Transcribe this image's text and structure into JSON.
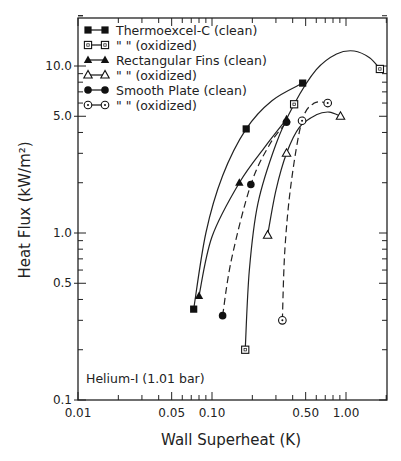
{
  "chart_data": {
    "type": "line",
    "title": "",
    "xlabel": "Wall Superheat (K)",
    "ylabel": "Heat Flux (kW/m²)",
    "xscale": "log",
    "yscale": "log",
    "xlim": [
      0.01,
      2.0
    ],
    "ylim": [
      0.1,
      31
    ],
    "x_ticks": [
      {
        "value": 0.01,
        "label": "0.01"
      },
      {
        "value": 0.05,
        "label": "0.05"
      },
      {
        "value": 0.1,
        "label": "0.10"
      },
      {
        "value": 0.5,
        "label": "0.50"
      },
      {
        "value": 1.0,
        "label": "1.00"
      }
    ],
    "y_ticks": [
      {
        "value": 0.1,
        "label": "0.1"
      },
      {
        "value": 0.5,
        "label": "0.5"
      },
      {
        "value": 1.0,
        "label": "1.0"
      },
      {
        "value": 5.0,
        "label": "5.0"
      },
      {
        "value": 10.0,
        "label": "10.0"
      }
    ],
    "grid": false,
    "legend_position": "upper-left",
    "annotation": "Helium-I (1.01 bar)",
    "series": [
      {
        "name": "Thermoexcel-C (clean)",
        "legend_label": "Thermoexcel-C (clean)",
        "marker": "square-filled",
        "line": "solid",
        "points": [
          [
            0.073,
            0.35
          ],
          [
            0.18,
            4.2
          ],
          [
            0.475,
            7.9
          ]
        ],
        "curve": [
          [
            0.073,
            0.35
          ],
          [
            0.09,
            1.0
          ],
          [
            0.12,
            2.2
          ],
          [
            0.18,
            4.2
          ],
          [
            0.28,
            6.2
          ],
          [
            0.475,
            7.9
          ]
        ]
      },
      {
        "name": "Thermoexcel-C (oxidized)",
        "legend_label": "\"        \"  (oxidized)",
        "marker": "square-open",
        "line": "solid",
        "points": [
          [
            0.177,
            0.2
          ],
          [
            0.41,
            5.9
          ],
          [
            1.79,
            9.6
          ]
        ],
        "curve": [
          [
            0.177,
            0.2
          ],
          [
            0.19,
            0.6
          ],
          [
            0.22,
            1.5
          ],
          [
            0.3,
            3.4
          ],
          [
            0.41,
            5.9
          ],
          [
            0.6,
            9.5
          ],
          [
            0.85,
            11.8
          ],
          [
            1.15,
            12.3
          ],
          [
            1.5,
            11.2
          ],
          [
            1.79,
            9.6
          ]
        ]
      },
      {
        "name": "Rectangular Fins (clean)",
        "legend_label": "Rectangular Fins (clean)",
        "marker": "triangle-filled",
        "line": "solid",
        "points": [
          [
            0.08,
            0.42
          ],
          [
            0.16,
            2.0
          ],
          [
            0.36,
            4.8
          ]
        ],
        "curve": [
          [
            0.08,
            0.42
          ],
          [
            0.1,
            0.95
          ],
          [
            0.16,
            2.0
          ],
          [
            0.25,
            3.3
          ],
          [
            0.36,
            4.8
          ]
        ]
      },
      {
        "name": "Rectangular Fins (oxidized)",
        "legend_label": "\"        \"  (oxidized)",
        "marker": "triangle-open",
        "line": "solid",
        "points": [
          [
            0.26,
            0.97
          ],
          [
            0.36,
            3.0
          ],
          [
            0.91,
            5.0
          ]
        ],
        "curve": [
          [
            0.26,
            0.97
          ],
          [
            0.3,
            1.8
          ],
          [
            0.36,
            3.0
          ],
          [
            0.45,
            4.3
          ],
          [
            0.6,
            5.1
          ],
          [
            0.75,
            5.3
          ],
          [
            0.91,
            5.0
          ]
        ]
      },
      {
        "name": "Smooth Plate (clean)",
        "legend_label": "Smooth Plate (clean)",
        "marker": "circle-filled",
        "line": "dashed",
        "points": [
          [
            0.12,
            0.32
          ],
          [
            0.195,
            1.95
          ],
          [
            0.36,
            4.6
          ]
        ],
        "curve": [
          [
            0.12,
            0.32
          ],
          [
            0.14,
            0.7
          ],
          [
            0.195,
            1.95
          ],
          [
            0.27,
            3.4
          ],
          [
            0.36,
            4.6
          ]
        ]
      },
      {
        "name": "Smooth Plate (oxidized)",
        "legend_label": "\"        \"  (oxidized)",
        "marker": "circle-half",
        "line": "dashed",
        "points": [
          [
            0.335,
            0.3
          ],
          [
            0.47,
            4.7
          ],
          [
            0.73,
            6.0
          ]
        ],
        "curve": [
          [
            0.335,
            0.3
          ],
          [
            0.35,
            0.8
          ],
          [
            0.39,
            2.0
          ],
          [
            0.47,
            4.7
          ],
          [
            0.58,
            6.0
          ],
          [
            0.73,
            6.0
          ]
        ]
      }
    ]
  },
  "legend": {
    "items": [
      {
        "label": "Thermoexcel-C (clean)"
      },
      {
        "label": "\"      \"  (oxidized)"
      },
      {
        "label": "Rectangular Fins (clean)"
      },
      {
        "label": "\"      \"  (oxidized)"
      },
      {
        "label": "Smooth Plate (clean)"
      },
      {
        "label": "\"      \"  (oxidized)"
      }
    ]
  },
  "axes": {
    "xlabel": "Wall Superheat (K)",
    "ylabel": "Heat Flux (kW/m²)"
  },
  "annotation": "Helium-I (1.01 bar)"
}
